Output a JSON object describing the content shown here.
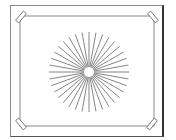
{
  "illustration": {
    "subject": "framed starburst picture with taped corners",
    "colors": {
      "background": "#ffffff",
      "frame": "#8a8a8a",
      "frame_shadow": "#333333",
      "lines": "#777777",
      "tape": "#666666"
    },
    "starburst": {
      "center": [
        89,
        72
      ],
      "radius": 40,
      "inner_radius": 5,
      "ray_count": 36
    }
  }
}
